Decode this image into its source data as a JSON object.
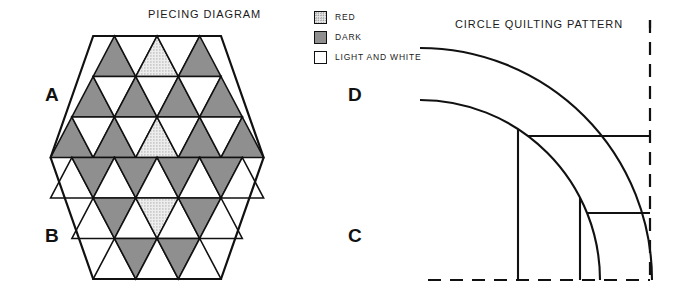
{
  "piecing": {
    "title": "PIECING DIAGRAM",
    "corner_labels": [
      "A",
      "D",
      "B",
      "C"
    ],
    "label_A": "A",
    "label_B": "B",
    "label_C": "C",
    "label_D": "D",
    "colors": {
      "dark": "#8f8f8f",
      "red": "#e3e3e3",
      "white": "#ffffff",
      "outline": "#111111"
    },
    "rows": [
      {
        "index": 1,
        "start_col": 4,
        "cells": [
          "dark",
          "white",
          "red",
          "white",
          "dark"
        ]
      },
      {
        "index": 2,
        "start_col": 3,
        "cells": [
          "dark",
          "white",
          "dark",
          "white",
          "dark",
          "white",
          "dark"
        ]
      },
      {
        "index": 3,
        "start_col": 2,
        "cells": [
          "dark",
          "white",
          "dark",
          "white",
          "red",
          "white",
          "dark",
          "white",
          "dark"
        ]
      },
      {
        "index": 4,
        "start_col": 2,
        "cells": [
          "white",
          "dark",
          "white",
          "dark",
          "white",
          "dark",
          "white",
          "dark",
          "white"
        ]
      },
      {
        "index": 5,
        "start_col": 3,
        "cells": [
          "white",
          "dark",
          "white",
          "red",
          "white",
          "dark",
          "white"
        ]
      },
      {
        "index": 6,
        "start_col": 4,
        "cells": [
          "white",
          "dark",
          "white",
          "dark",
          "white"
        ]
      }
    ]
  },
  "legend": {
    "items": [
      {
        "swatch": "red",
        "label": "RED"
      },
      {
        "swatch": "dark",
        "label": "DARK"
      },
      {
        "swatch": "white",
        "label": "LIGHT AND WHITE"
      }
    ]
  },
  "circle": {
    "title": "CIRCLE QUILTING PATTERN",
    "outer_arc_radius": 232,
    "inner_arc_radius": 180,
    "dashed_edges": [
      "right",
      "bottom"
    ],
    "grid_line_count": 4
  }
}
